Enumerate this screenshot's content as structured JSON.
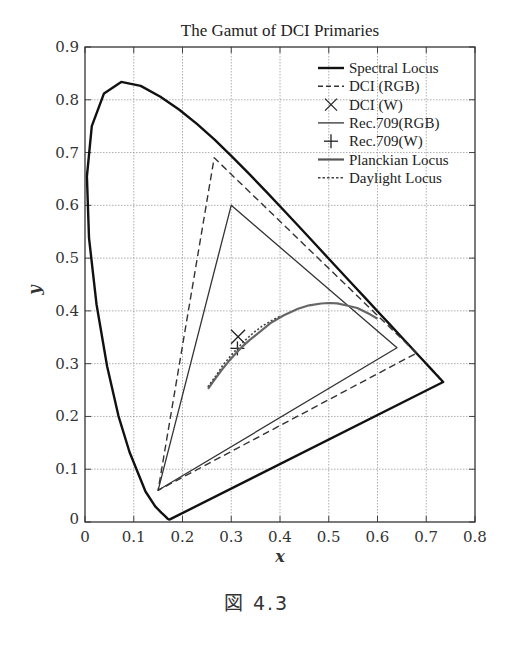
{
  "figure": {
    "caption": "図 4.3"
  },
  "chart_data": {
    "type": "line",
    "title": "The Gamut of DCI Primaries",
    "xlabel": "x",
    "ylabel": "y",
    "xlim": [
      0,
      0.8
    ],
    "ylim": [
      0,
      0.9
    ],
    "x_ticks": [
      "0",
      "0.1",
      "0.2",
      "0.3",
      "0.4",
      "0.5",
      "0.6",
      "0.7",
      "0.8"
    ],
    "y_ticks": [
      "0",
      "0.1",
      "0.2",
      "0.3",
      "0.4",
      "0.5",
      "0.6",
      "0.7",
      "0.8",
      "0.9"
    ],
    "grid": true,
    "legend_position": "upper right",
    "legend": [
      {
        "label": "Spectral Locus",
        "style": "solid-thick"
      },
      {
        "label": "DCI (RGB)",
        "style": "dashed"
      },
      {
        "label": "DCI (W)",
        "style": "x-marker"
      },
      {
        "label": "Rec.709(RGB)",
        "style": "solid-thin"
      },
      {
        "label": "Rec.709(W)",
        "style": "plus-marker"
      },
      {
        "label": "Planckian Locus",
        "style": "solid-gray"
      },
      {
        "label": "Daylight Locus",
        "style": "dotted"
      }
    ],
    "series": [
      {
        "name": "Spectral Locus",
        "x": [
          0.1741,
          0.1738,
          0.1733,
          0.1726,
          0.1714,
          0.1689,
          0.1644,
          0.1566,
          0.144,
          0.1241,
          0.0913,
          0.0687,
          0.0454,
          0.0235,
          0.0082,
          0.0039,
          0.0139,
          0.0389,
          0.0743,
          0.1142,
          0.1547,
          0.1929,
          0.2296,
          0.2658,
          0.3016,
          0.3373,
          0.3731,
          0.4087,
          0.4441,
          0.4788,
          0.5125,
          0.5448,
          0.5752,
          0.6029,
          0.627,
          0.6482,
          0.6658,
          0.6801,
          0.6915,
          0.7006,
          0.7079,
          0.714,
          0.719,
          0.723,
          0.726,
          0.7283,
          0.73,
          0.7311,
          0.732,
          0.7347
        ],
        "y": [
          0.005,
          0.0049,
          0.0048,
          0.0048,
          0.0051,
          0.0069,
          0.0109,
          0.0177,
          0.0297,
          0.0578,
          0.1327,
          0.2007,
          0.295,
          0.4127,
          0.5384,
          0.6548,
          0.7502,
          0.812,
          0.8338,
          0.8262,
          0.8059,
          0.7816,
          0.7543,
          0.7243,
          0.6923,
          0.6589,
          0.6245,
          0.5896,
          0.5547,
          0.5202,
          0.4866,
          0.4544,
          0.4242,
          0.3965,
          0.3725,
          0.3514,
          0.334,
          0.3197,
          0.3083,
          0.2993,
          0.292,
          0.2859,
          0.2809,
          0.277,
          0.274,
          0.2717,
          0.27,
          0.2689,
          0.268,
          0.2653
        ],
        "closed": true
      },
      {
        "name": "DCI (RGB)",
        "points": [
          [
            0.68,
            0.32
          ],
          [
            0.265,
            0.69
          ],
          [
            0.15,
            0.06
          ]
        ],
        "closed": true
      },
      {
        "name": "DCI (W)",
        "points": [
          [
            0.314,
            0.351
          ]
        ]
      },
      {
        "name": "Rec.709(RGB)",
        "points": [
          [
            0.64,
            0.33
          ],
          [
            0.3,
            0.6
          ],
          [
            0.15,
            0.06
          ]
        ],
        "closed": true
      },
      {
        "name": "Rec.709(W)",
        "points": [
          [
            0.3127,
            0.329
          ]
        ]
      },
      {
        "name": "Planckian Locus",
        "x": [
          0.2525,
          0.265,
          0.2806,
          0.2952,
          0.3135,
          0.3221,
          0.3381,
          0.347,
          0.3805,
          0.408,
          0.4369,
          0.4599,
          0.4846,
          0.5008,
          0.5174,
          0.537,
          0.5586,
          0.5857,
          0.6
        ],
        "y": [
          0.2522,
          0.2687,
          0.2883,
          0.3048,
          0.3236,
          0.3318,
          0.3451,
          0.3516,
          0.3768,
          0.3916,
          0.4041,
          0.4106,
          0.414,
          0.415,
          0.4141,
          0.4103,
          0.4055,
          0.393,
          0.385
        ]
      },
      {
        "name": "Daylight Locus",
        "x": [
          0.252,
          0.271,
          0.2824,
          0.299,
          0.3127,
          0.3248,
          0.3457,
          0.3632,
          0.3805,
          0.4
        ],
        "y": [
          0.256,
          0.28,
          0.297,
          0.315,
          0.329,
          0.341,
          0.3586,
          0.371,
          0.3805,
          0.39
        ]
      }
    ]
  }
}
